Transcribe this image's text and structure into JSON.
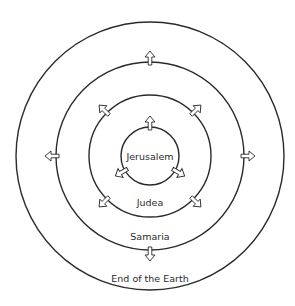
{
  "diagram": {
    "type": "concentric-circles",
    "center": {
      "x": 150,
      "y": 156
    },
    "rings": [
      {
        "name": "jerusalem",
        "label": "Jerusalem",
        "radius": 29,
        "label_pos": {
          "x": 150,
          "y": 160
        },
        "arrow_angles": [
          -90,
          150,
          30
        ]
      },
      {
        "name": "judea",
        "label": "Judea",
        "radius": 61,
        "label_pos": {
          "x": 150,
          "y": 206
        },
        "arrow_angles": [
          -135,
          -45,
          135,
          45
        ]
      },
      {
        "name": "samaria",
        "label": "Samaria",
        "radius": 94,
        "label_pos": {
          "x": 150,
          "y": 240
        },
        "arrow_angles": [
          -90,
          0,
          90,
          180
        ]
      },
      {
        "name": "end-of-the-earth",
        "label": "End of the Earth",
        "radius": 134,
        "label_pos": {
          "x": 150,
          "y": 282
        },
        "arrow_angles": []
      }
    ],
    "colors": {
      "stroke": "#2a2a2a",
      "background": "#ffffff"
    }
  }
}
